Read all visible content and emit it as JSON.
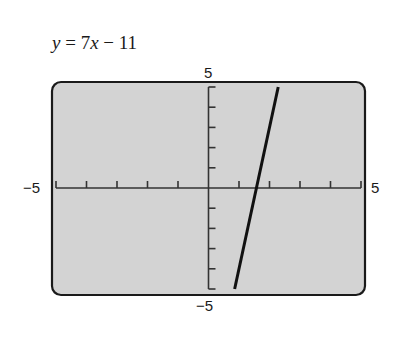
{
  "chart_data": {
    "type": "line",
    "title": "y = 7x − 11",
    "equation": {
      "y": "y",
      "equals": " = ",
      "coef": "7",
      "x": "x",
      "rest": " − 11"
    },
    "xlabel": "",
    "ylabel": "",
    "xlim": [
      -5,
      5
    ],
    "ylim": [
      -5,
      5
    ],
    "xscl": 1,
    "yscl": 1,
    "grid": false,
    "series": [
      {
        "name": "y = 7x − 11",
        "slope": 7,
        "intercept": -11,
        "x": [
          0.857,
          2.286
        ],
        "y": [
          -5,
          5
        ]
      }
    ],
    "axis_labels": {
      "xmin": "−5",
      "xmax": "5",
      "ymin": "−5",
      "ymax": "5"
    }
  },
  "colors": {
    "screen_fill": "#d3d3d3",
    "frame": "#1a1a1a",
    "line": "#111111",
    "axis": "#333333"
  }
}
